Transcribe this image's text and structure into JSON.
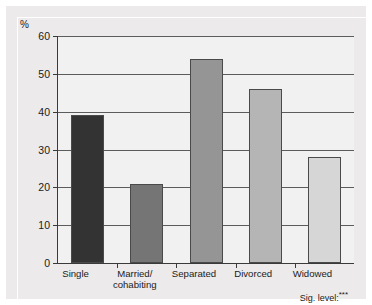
{
  "chart_data": {
    "type": "bar",
    "title": "",
    "subtitle": "",
    "xlabel": "",
    "ylabel": "%",
    "ylim": [
      0,
      60
    ],
    "ytick_values": [
      0,
      10,
      20,
      30,
      40,
      50,
      60
    ],
    "ytick_labels": [
      "0",
      "10",
      "20",
      "30",
      "40",
      "50",
      "60"
    ],
    "grid": true,
    "legend": false,
    "categories": [
      "Single",
      "Married/\ncohabiting",
      "Separated",
      "Divorced",
      "Widowed"
    ],
    "values": [
      39,
      21,
      54,
      46,
      28
    ],
    "bar_colors": [
      "#333333",
      "#757575",
      "#959595",
      "#b5b5b5",
      "#d6d6d6"
    ],
    "annotations": [
      {
        "name": "significance-level",
        "prefix": "Sig. level:",
        "stars": "***",
        "position": "bottom-right"
      }
    ]
  },
  "axis": {
    "unit_label": "%",
    "tick_labels": [
      "60",
      "50",
      "40",
      "30",
      "20",
      "10",
      "0"
    ]
  },
  "categories": [
    {
      "line1": "Single",
      "line2": ""
    },
    {
      "line1": "Married/",
      "line2": "cohabiting"
    },
    {
      "line1": "Separated",
      "line2": ""
    },
    {
      "line1": "Divorced",
      "line2": ""
    },
    {
      "line1": "Widowed",
      "line2": ""
    }
  ],
  "footnote": {
    "prefix": "Sig. level:",
    "stars": "***"
  },
  "colors": {
    "page_background": "#eceaea",
    "plot_background": "#f2f1f1",
    "axis": "#3a3a3a",
    "gridline": "#5c5c5c",
    "text": "#1b1b1b"
  }
}
